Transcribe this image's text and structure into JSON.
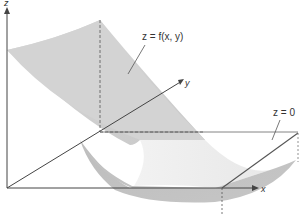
{
  "figure": {
    "surface_label": "z = f(x, y)",
    "plane_label": "z = 0",
    "axes": {
      "x": "x",
      "y": "y",
      "z": "z"
    }
  },
  "colors": {
    "surface_upper": "#d4d4d4",
    "surface_lower": "#bdbdbd",
    "surface_highlight": "#eeeeee",
    "axis": "#444444",
    "dashed": "#555555"
  }
}
